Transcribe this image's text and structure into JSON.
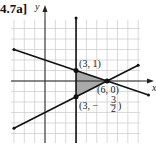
{
  "figure": {
    "title": "4.7a]",
    "x_axis_label": "x",
    "y_axis_label": "y",
    "grid": true,
    "x_range": [
      -3,
      9
    ],
    "y_range": [
      -6,
      6
    ],
    "shaded_color": "#a9a9a9",
    "line_color": "#111111",
    "grid_color": "#cfcfcf"
  },
  "chart_data": {
    "type": "line",
    "title": "4.7a]",
    "xlabel": "x",
    "ylabel": "y",
    "lines": [
      {
        "name": "upper-boundary",
        "equation": "y = -x/3 + 2",
        "points": [
          [
            -3,
            3
          ],
          [
            6,
            0
          ],
          [
            10,
            -1.333
          ]
        ]
      },
      {
        "name": "lower-boundary",
        "equation": "y = x/2 - 3",
        "points": [
          [
            -3,
            -4.5
          ],
          [
            6,
            0
          ],
          [
            9,
            1.5
          ]
        ]
      },
      {
        "name": "vertical-boundary",
        "equation": "x = 3",
        "points": [
          [
            3,
            -6
          ],
          [
            3,
            6
          ]
        ]
      }
    ],
    "shaded_region": [
      [
        3,
        1
      ],
      [
        6,
        0
      ],
      [
        3,
        -1.5
      ]
    ],
    "vertices": [
      {
        "x": 3,
        "y": 1,
        "label": "(3, 1)"
      },
      {
        "x": 6,
        "y": 0,
        "label": "(6, 0)"
      },
      {
        "x": 3,
        "y": -1.5,
        "label_prefix": "(3, −",
        "label_num": "3",
        "label_den": "2",
        "label_suffix": ")"
      }
    ]
  }
}
